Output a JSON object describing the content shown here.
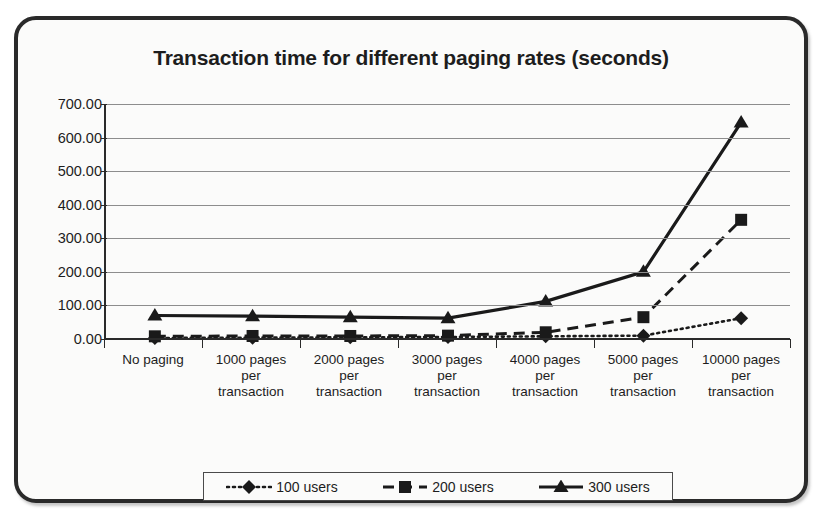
{
  "chart_data": {
    "type": "line",
    "title": "Transaction time for different paging rates (seconds)",
    "xlabel": "",
    "ylabel": "",
    "ylim": [
      0,
      700
    ],
    "ytick_step": 100,
    "ytick_labels": [
      "700.00",
      "600.00",
      "500.00",
      "400.00",
      "300.00",
      "200.00",
      "100.00",
      "0.00"
    ],
    "ytick_values": [
      700,
      600,
      500,
      400,
      300,
      200,
      100,
      0
    ],
    "grid": true,
    "legend_position": "bottom",
    "categories": [
      "No paging",
      "1000 pages per transaction",
      "2000 pages per transaction",
      "3000 pages per transaction",
      "4000 pages per transaction",
      "5000 pages per transaction",
      "10000 pages per transaction"
    ],
    "category_lines": [
      [
        "No paging"
      ],
      [
        "1000 pages",
        "per",
        "transaction"
      ],
      [
        "2000 pages",
        "per",
        "transaction"
      ],
      [
        "3000 pages",
        "per",
        "transaction"
      ],
      [
        "4000 pages",
        "per",
        "transaction"
      ],
      [
        "5000 pages",
        "per",
        "transaction"
      ],
      [
        "10000 pages",
        "per",
        "transaction"
      ]
    ],
    "series": [
      {
        "name": "100 users",
        "values": [
          3,
          4,
          5,
          6,
          8,
          10,
          62
        ],
        "marker": "diamond",
        "line_style": "dotted",
        "color": "#1a1a1a"
      },
      {
        "name": "200 users",
        "values": [
          8,
          9,
          9,
          10,
          20,
          65,
          355
        ],
        "marker": "square",
        "line_style": "dashed",
        "color": "#1a1a1a"
      },
      {
        "name": "300 users",
        "values": [
          70,
          68,
          65,
          62,
          112,
          200,
          645
        ],
        "marker": "triangle",
        "line_style": "solid",
        "color": "#1a1a1a"
      }
    ]
  },
  "legend": {
    "entries": [
      {
        "label": "100 users"
      },
      {
        "label": "200 users"
      },
      {
        "label": "300 users"
      }
    ]
  }
}
